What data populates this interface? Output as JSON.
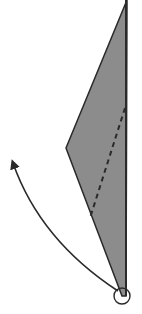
{
  "diagram": {
    "type": "geometry-rotation",
    "background": "#ffffff",
    "shape": {
      "fill": "#8c8c8c",
      "stroke": "#2a2a2a",
      "points": [
        [
          127,
          0
        ],
        [
          66,
          148
        ],
        [
          122,
          296
        ],
        [
          126,
          296
        ]
      ]
    },
    "fold_line": {
      "style": "dashed",
      "x1": 125,
      "y1": 108,
      "x2": 90,
      "y2": 218,
      "color": "#2a2a2a"
    },
    "rotation_arrow": {
      "direction": "counter-clockwise",
      "start": [
        118,
        291
      ],
      "control": [
        40,
        240
      ],
      "end": [
        12,
        162
      ],
      "color": "#2a2a2a"
    },
    "pivot": {
      "cx": 122,
      "cy": 296,
      "r": 8,
      "color": "#2a2a2a"
    }
  }
}
